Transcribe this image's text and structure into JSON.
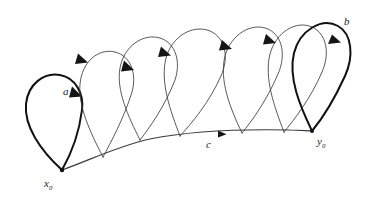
{
  "figure": {
    "kind": "loop-composition-diagram",
    "background_color": "#ffffff",
    "ink_color": "#3b3b3b",
    "bold_ink_color": "#111111",
    "labels": {
      "a": {
        "text": "a",
        "x": 63,
        "y": 86
      },
      "b": {
        "text": "b",
        "x": 344,
        "y": 16
      },
      "c": {
        "text": "c",
        "x": 206,
        "y": 139
      },
      "x0": {
        "base": "x",
        "subscript": "0",
        "x": 44,
        "y": 178
      },
      "y0": {
        "base": "y",
        "subscript": "0",
        "x": 317,
        "y": 136
      }
    },
    "endpoints": [
      {
        "name": "x0",
        "x": 62,
        "y": 170
      },
      {
        "name": "y0",
        "x": 312,
        "y": 131
      }
    ],
    "base_curve": {
      "name": "c",
      "from": "x0",
      "to": "y0",
      "arrow_at": {
        "x": 218,
        "y": 134
      },
      "stroke": "#3b3b3b",
      "stroke_width": 1.15
    },
    "loops": [
      {
        "index": 1,
        "name": "loop-a",
        "emphasis": "bold",
        "base_x": 62,
        "base_y": 170,
        "apex_x": 55,
        "apex_y": 78,
        "arrow_x": 76,
        "arrow_y": 96
      },
      {
        "index": 2,
        "name": "loop-2",
        "emphasis": "thin",
        "base_x": 103,
        "base_y": 157,
        "apex_x": 98,
        "apex_y": 43,
        "arrow_x": 85,
        "arrow_y": 60
      },
      {
        "index": 3,
        "name": "loop-3",
        "emphasis": "thin",
        "base_x": 140,
        "base_y": 140,
        "apex_x": 139,
        "apex_y": 28,
        "arrow_x": 130,
        "arrow_y": 68
      },
      {
        "index": 4,
        "name": "loop-4",
        "emphasis": "thin",
        "base_x": 180,
        "base_y": 136,
        "apex_x": 196,
        "apex_y": 24,
        "arrow_x": 168,
        "arrow_y": 54
      },
      {
        "index": 5,
        "name": "loop-5",
        "emphasis": "thin",
        "base_x": 242,
        "base_y": 133,
        "apex_x": 240,
        "apex_y": 18,
        "arrow_x": 229,
        "arrow_y": 47
      },
      {
        "index": 6,
        "name": "loop-6",
        "emphasis": "thin",
        "base_x": 284,
        "base_y": 132,
        "apex_x": 283,
        "apex_y": 14,
        "arrow_x": 273,
        "arrow_y": 41
      },
      {
        "index": 7,
        "name": "loop-b",
        "emphasis": "bold",
        "base_x": 312,
        "base_y": 131,
        "apex_x": 310,
        "apex_y": 12,
        "arrow_x": 340,
        "arrow_y": 40
      }
    ],
    "loop_count": 7,
    "arrow_count": 8
  }
}
